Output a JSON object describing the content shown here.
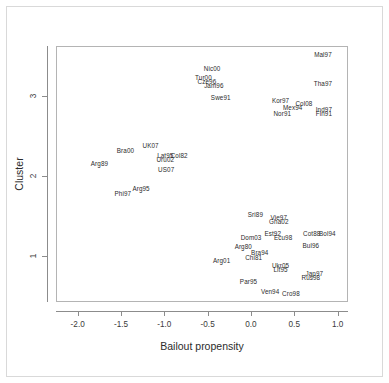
{
  "chart_data": {
    "type": "scatter",
    "title": "",
    "xlabel": "Bailout propensity",
    "ylabel": "Cluster",
    "xlim": [
      -2.25,
      1.12
    ],
    "ylim": [
      0.42,
      3.62
    ],
    "xticks": [
      -2.0,
      -1.5,
      -1.0,
      -0.5,
      0.0,
      0.5,
      1.0
    ],
    "xticklabels": [
      "-2.0",
      "-1.5",
      "-1.0",
      "-0.5",
      "0.0",
      "0.5",
      "1.0"
    ],
    "yticks": [
      1,
      2,
      3
    ],
    "yticklabels": [
      "1",
      "2",
      "3"
    ],
    "grid": false,
    "legend": null,
    "marker": "text-label",
    "points": [
      {
        "label": "Mal97",
        "x": 0.82,
        "y": 3.53
      },
      {
        "label": "Nic00",
        "x": -0.46,
        "y": 3.36
      },
      {
        "label": "Tur00",
        "x": -0.56,
        "y": 3.24
      },
      {
        "label": "Cze96",
        "x": -0.52,
        "y": 3.2
      },
      {
        "label": "Jam96",
        "x": -0.44,
        "y": 3.15
      },
      {
        "label": "Tha97",
        "x": 0.82,
        "y": 3.17
      },
      {
        "label": "Swe91",
        "x": -0.36,
        "y": 3.0
      },
      {
        "label": "Kor97",
        "x": 0.33,
        "y": 2.96
      },
      {
        "label": "Col08",
        "x": 0.6,
        "y": 2.92
      },
      {
        "label": "Mex94",
        "x": 0.47,
        "y": 2.87
      },
      {
        "label": "Ind97",
        "x": 0.83,
        "y": 2.85
      },
      {
        "label": "Nor91",
        "x": 0.35,
        "y": 2.79
      },
      {
        "label": "Fin91",
        "x": 0.83,
        "y": 2.79
      },
      {
        "label": "UK07",
        "x": -1.17,
        "y": 2.4
      },
      {
        "label": "Bra00",
        "x": -1.46,
        "y": 2.33
      },
      {
        "label": "Lat95",
        "x": -1.0,
        "y": 2.27
      },
      {
        "label": "Col82",
        "x": -0.84,
        "y": 2.27
      },
      {
        "label": "Uru02",
        "x": -1.0,
        "y": 2.22
      },
      {
        "label": "Arg89",
        "x": -1.76,
        "y": 2.17
      },
      {
        "label": "US07",
        "x": -0.99,
        "y": 2.1
      },
      {
        "label": "Arg95",
        "x": -1.28,
        "y": 1.86
      },
      {
        "label": "Phi97",
        "x": -1.49,
        "y": 1.8
      },
      {
        "label": "Sri89",
        "x": 0.04,
        "y": 1.53
      },
      {
        "label": "Vie97",
        "x": 0.31,
        "y": 1.49
      },
      {
        "label": "Gha02",
        "x": 0.31,
        "y": 1.44
      },
      {
        "label": "Est92",
        "x": 0.24,
        "y": 1.3
      },
      {
        "label": "Cot88",
        "x": 0.69,
        "y": 1.3
      },
      {
        "label": "Bol94",
        "x": 0.87,
        "y": 1.3
      },
      {
        "label": "Dom03",
        "x": -0.01,
        "y": 1.24
      },
      {
        "label": "Ecu98",
        "x": 0.36,
        "y": 1.24
      },
      {
        "label": "Arg80",
        "x": -0.1,
        "y": 1.13
      },
      {
        "label": "Bul96",
        "x": 0.68,
        "y": 1.15
      },
      {
        "label": "Bra94",
        "x": 0.09,
        "y": 1.06
      },
      {
        "label": "Chi81",
        "x": 0.02,
        "y": 1.0
      },
      {
        "label": "Arg01",
        "x": -0.35,
        "y": 0.96
      },
      {
        "label": "Ukr05",
        "x": 0.33,
        "y": 0.89
      },
      {
        "label": "Lit95",
        "x": 0.33,
        "y": 0.84
      },
      {
        "label": "Jap97",
        "x": 0.72,
        "y": 0.8
      },
      {
        "label": "Rus98",
        "x": 0.68,
        "y": 0.75
      },
      {
        "label": "Par95",
        "x": -0.04,
        "y": 0.7
      },
      {
        "label": "Ven94",
        "x": 0.21,
        "y": 0.57
      },
      {
        "label": "Cro98",
        "x": 0.45,
        "y": 0.55
      }
    ]
  },
  "colors": {
    "text": "#2b2b2b",
    "axis": "#8c8c8c",
    "panel_border": "#b4b4b4",
    "frame": "#d9d9d9",
    "background": "#ffffff"
  }
}
